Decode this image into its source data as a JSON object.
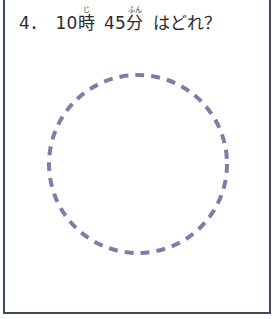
{
  "worksheet": {
    "frame_color": "#3d4a63",
    "background_color": "#ffffff",
    "question": {
      "number_label": "4．",
      "hour_value": "10",
      "hour_kanji": "時",
      "hour_furigana": "じ",
      "minute_value": "45",
      "minute_kanji": "分",
      "minute_furigana": "ふん",
      "prompt_tail": "はどれ？",
      "text_color": "#2b2b2b",
      "full_text": "4．10時　45分　はどれ？"
    },
    "answer_area": {
      "clock_face": {
        "shape_name": "dashed-circle",
        "stroke_color": "#7b7fa8",
        "stroke_width": "4",
        "dash_length": "9",
        "dash_gap": "7",
        "diameter": "182",
        "fill": "none"
      }
    }
  }
}
